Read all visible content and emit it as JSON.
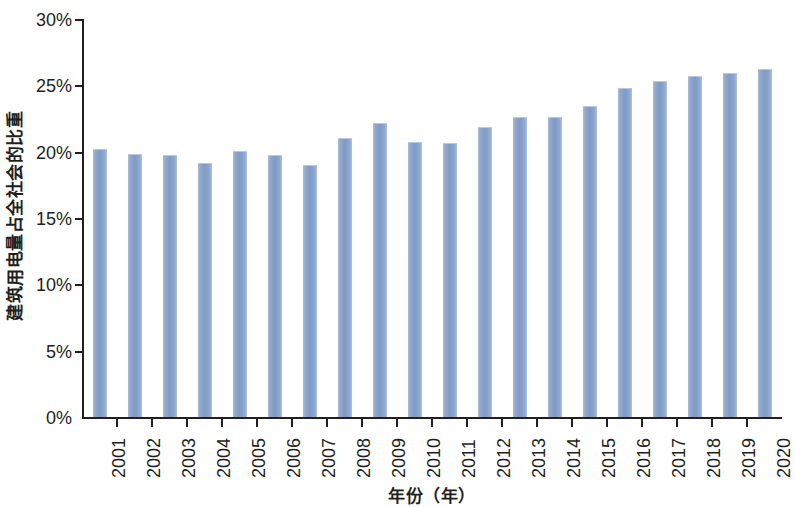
{
  "chart_data": {
    "type": "bar",
    "title": "",
    "subtitle": "",
    "xlabel": "年份（年）",
    "ylabel": "建筑用电量占全社会的比重",
    "categories": [
      "2001",
      "2002",
      "2003",
      "2004",
      "2005",
      "2006",
      "2007",
      "2008",
      "2009",
      "2010",
      "2011",
      "2012",
      "2013",
      "2014",
      "2015",
      "2016",
      "2017",
      "2018",
      "2019",
      "2020"
    ],
    "values": [
      20.3,
      19.9,
      19.8,
      19.2,
      20.1,
      19.8,
      19.1,
      21.1,
      22.2,
      20.8,
      20.7,
      21.9,
      22.7,
      22.7,
      23.5,
      24.9,
      25.4,
      25.8,
      26.0,
      26.3
    ],
    "value_unit": "%",
    "ylim": [
      0,
      30
    ],
    "y_ticks": [
      0,
      5,
      10,
      15,
      20,
      25,
      30
    ],
    "y_tick_labels": [
      "0%",
      "5%",
      "10%",
      "15%",
      "20%",
      "25%",
      "30%"
    ],
    "grid": false,
    "legend": false,
    "legend_position": "none",
    "series": [
      {
        "name": "建筑用电量占全社会的比重",
        "color": "#7e9bc6",
        "values": [
          20.3,
          19.9,
          19.8,
          19.2,
          20.1,
          19.8,
          19.1,
          21.1,
          22.2,
          20.8,
          20.7,
          21.9,
          22.7,
          22.7,
          23.5,
          24.9,
          25.4,
          25.8,
          26.0,
          26.3
        ]
      }
    ]
  },
  "axes": {
    "y_title": "建筑用电量占全社会的比重",
    "x_title": "年份（年）"
  },
  "colors": {
    "bar": "#7e9bc6",
    "bar_light": "#a8bcd8",
    "axis": "#231f20",
    "background": "#ffffff"
  }
}
